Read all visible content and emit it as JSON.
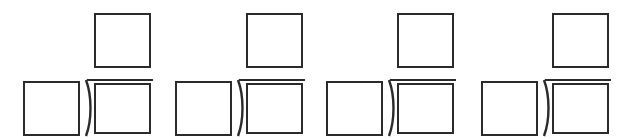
{
  "worksheet": {
    "type": "long-division-templates",
    "problem_count": 4,
    "problems": [
      {
        "left": 23,
        "divisor": "",
        "quotient": "",
        "dividend": ""
      },
      {
        "left": 175,
        "divisor": "",
        "quotient": "",
        "dividend": ""
      },
      {
        "left": 326,
        "divisor": "",
        "quotient": "",
        "dividend": ""
      },
      {
        "left": 481,
        "divisor": "",
        "quotient": "",
        "dividend": ""
      }
    ],
    "colors": {
      "stroke": "#2b2b2b",
      "background": "#ffffff"
    }
  }
}
